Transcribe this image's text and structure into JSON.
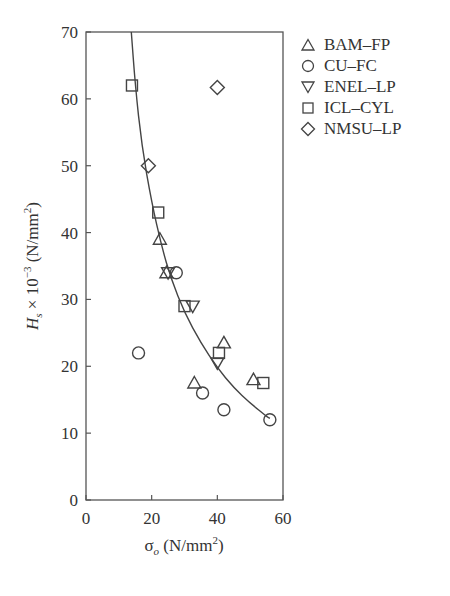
{
  "chart_data": {
    "type": "scatter",
    "title": "",
    "xlabel": "σo (N/mm²)",
    "ylabel": "Hs × 10⁻³ (N/mm²)",
    "xlim": [
      0,
      60
    ],
    "ylim": [
      0,
      70
    ],
    "x_ticks": [
      0,
      20,
      40,
      60
    ],
    "y_ticks": [
      0,
      10,
      20,
      30,
      40,
      50,
      60,
      70
    ],
    "grid": false,
    "legend_position": "right-outside-top",
    "series": [
      {
        "name": "BAM–FP",
        "marker": "triangle-up",
        "points": [
          [
            22.5,
            39
          ],
          [
            24.5,
            34
          ],
          [
            33,
            17.5
          ],
          [
            42,
            23.5
          ],
          [
            51,
            18
          ]
        ]
      },
      {
        "name": "CU–FC",
        "marker": "circle",
        "points": [
          [
            16,
            22
          ],
          [
            27.5,
            34
          ],
          [
            35.5,
            16
          ],
          [
            42,
            13.5
          ],
          [
            56,
            12
          ]
        ]
      },
      {
        "name": "ENEL–LP",
        "marker": "triangle-down",
        "points": [
          [
            25,
            34
          ],
          [
            32.5,
            29
          ],
          [
            40,
            20.5
          ]
        ]
      },
      {
        "name": "ICL–CYL",
        "marker": "square",
        "points": [
          [
            14,
            62
          ],
          [
            22,
            43
          ],
          [
            30,
            29
          ],
          [
            40.5,
            22
          ],
          [
            54,
            17.5
          ]
        ]
      },
      {
        "name": "NMSU–LP",
        "marker": "diamond",
        "points": [
          [
            19,
            50
          ],
          [
            40,
            61.7
          ]
        ]
      }
    ],
    "fit_curve": {
      "description": "hyperbolic-like decreasing fit curve",
      "points": [
        [
          13.8,
          70
        ],
        [
          15,
          62
        ],
        [
          17,
          53
        ],
        [
          20,
          44.5
        ],
        [
          23,
          38
        ],
        [
          26,
          33
        ],
        [
          30,
          28
        ],
        [
          35,
          23.5
        ],
        [
          40,
          19.8
        ],
        [
          45,
          16.8
        ],
        [
          50,
          14.5
        ],
        [
          55,
          12.5
        ],
        [
          56,
          12.2
        ]
      ]
    }
  },
  "axes": {
    "x_tick_labels": [
      "0",
      "20",
      "40",
      "60"
    ],
    "y_tick_labels": [
      "0",
      "10",
      "20",
      "30",
      "40",
      "50",
      "60",
      "70"
    ],
    "xlabel_main": "σ",
    "xlabel_sub": "o",
    "xlabel_unit": " (N/mm",
    "xlabel_sup": "2",
    "xlabel_close": ")",
    "ylabel_main": "H",
    "ylabel_sub": "s",
    "ylabel_mid": " × 10",
    "ylabel_exp": "−3",
    "ylabel_unit": " (N/mm",
    "ylabel_sup": "2",
    "ylabel_close": ")"
  },
  "legend": {
    "items": [
      {
        "label": "BAM–FP",
        "icon": "triangle-up-icon"
      },
      {
        "label": "CU–FC",
        "icon": "circle-icon"
      },
      {
        "label": "ENEL–LP",
        "icon": "triangle-down-icon"
      },
      {
        "label": "ICL–CYL",
        "icon": "square-icon"
      },
      {
        "label": "NMSU–LP",
        "icon": "diamond-icon"
      }
    ]
  },
  "style": {
    "line_color": "#444444",
    "marker_color": "#444444"
  }
}
